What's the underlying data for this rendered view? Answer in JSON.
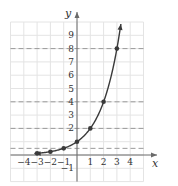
{
  "chart_data": {
    "type": "line",
    "title": "",
    "function": "y = 2^x",
    "xlabel": "x",
    "ylabel": "y",
    "xlim": [
      -5,
      5
    ],
    "ylim": [
      -2,
      10
    ],
    "grid": true,
    "x_ticks": [
      -4,
      -3,
      -2,
      -1,
      1,
      2,
      3,
      4
    ],
    "x_tick_labels": [
      "−4",
      "−3",
      "−2",
      "−1",
      "1",
      "2",
      "3",
      "4"
    ],
    "y_ticks": [
      -1,
      2,
      3,
      4,
      5,
      6,
      7,
      8,
      9
    ],
    "y_tick_labels": [
      "−1",
      "2",
      "3",
      "4",
      "5",
      "6",
      "7",
      "8",
      "9"
    ],
    "points": [
      {
        "x": -3,
        "y": 0.125
      },
      {
        "x": -2,
        "y": 0.25
      },
      {
        "x": -1,
        "y": 0.5
      },
      {
        "x": 0,
        "y": 1
      },
      {
        "x": 1,
        "y": 2
      },
      {
        "x": 2,
        "y": 4
      },
      {
        "x": 3,
        "y": 8
      }
    ],
    "dashed_reference_lines_y": [
      0.5,
      2,
      4,
      8
    ],
    "curve_x_range": [
      -3.2,
      3.3
    ],
    "arrow_at_ends": true
  },
  "colors": {
    "grid": "#e4e4e4",
    "axis": "#6a6a6a",
    "curve": "#3a3a3a",
    "dashed": "#9a9a9a",
    "point": "#3a3a3a"
  }
}
